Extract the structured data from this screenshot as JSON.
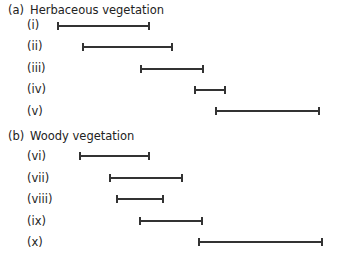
{
  "sections": [
    {
      "tag": "(a)",
      "title": "Herbaceous vegetation",
      "rows": [
        {
          "label": "(i)",
          "start": 57,
          "end": 150,
          "y": 26
        },
        {
          "label": "(ii)",
          "start": 82,
          "end": 173,
          "y": 47
        },
        {
          "label": "(iii)",
          "start": 140,
          "end": 204,
          "y": 69
        },
        {
          "label": "(iv)",
          "start": 194,
          "end": 226,
          "y": 90
        },
        {
          "label": "(v)",
          "start": 215,
          "end": 320,
          "y": 111
        }
      ]
    },
    {
      "tag": "(b)",
      "title": "Woody vegetation",
      "rows": [
        {
          "label": "(vi)",
          "start": 79,
          "end": 150,
          "y": 156
        },
        {
          "label": "(vii)",
          "start": 109,
          "end": 183,
          "y": 178
        },
        {
          "label": "(viii)",
          "start": 116,
          "end": 164,
          "y": 199
        },
        {
          "label": "(ix)",
          "start": 139,
          "end": 203,
          "y": 221
        },
        {
          "label": "(x)",
          "start": 198,
          "end": 323,
          "y": 242
        }
      ]
    }
  ]
}
